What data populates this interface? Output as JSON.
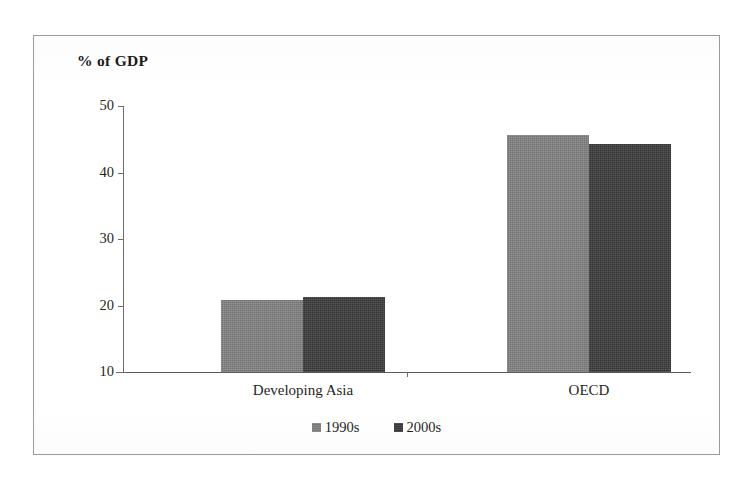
{
  "figure": {
    "axis_title": "% of GDP",
    "frame_color": "#9a9a9a",
    "background": "#ffffff"
  },
  "chart_data": {
    "type": "bar",
    "title": "",
    "ylabel": "% of GDP",
    "xlabel": "",
    "categories": [
      "Developing Asia",
      "OECD"
    ],
    "series": [
      {
        "name": "1990s",
        "values": [
          20.8,
          45.6
        ],
        "color": "#808080"
      },
      {
        "name": "2000s",
        "values": [
          21.3,
          44.3
        ],
        "color": "#3a3a3a"
      }
    ],
    "ylim": [
      10,
      50
    ],
    "yticks": [
      10,
      20,
      30,
      40,
      50
    ],
    "ytick_labels": [
      "10",
      "20",
      "30",
      "40",
      "50"
    ],
    "grid": false,
    "legend_position": "bottom"
  },
  "axis": {
    "ticks": [
      {
        "label": "50",
        "value": 50
      },
      {
        "label": "40",
        "value": 40
      },
      {
        "label": "30",
        "value": 30
      },
      {
        "label": "20",
        "value": 20
      },
      {
        "label": "10",
        "value": 10
      }
    ]
  },
  "legend": {
    "entries": [
      {
        "label": "1990s",
        "color": "#808080"
      },
      {
        "label": "2000s",
        "color": "#3a3a3a"
      }
    ]
  }
}
